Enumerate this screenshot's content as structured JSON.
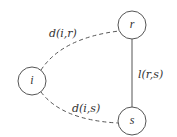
{
  "diagram": {
    "nodes": [
      {
        "id": "r",
        "label": "r",
        "cx": 132,
        "cy": 25,
        "r": 14
      },
      {
        "id": "i",
        "label": "i",
        "cx": 32,
        "cy": 81,
        "r": 14
      },
      {
        "id": "s",
        "label": "s",
        "cx": 132,
        "cy": 121,
        "r": 14
      }
    ],
    "edges": [
      {
        "from": "i",
        "to": "r",
        "label": "d(i,r)",
        "style": "dashed"
      },
      {
        "from": "i",
        "to": "s",
        "label": "d(i,s)",
        "style": "dashed"
      },
      {
        "from": "r",
        "to": "s",
        "label": "l(r,s)",
        "style": "solid"
      }
    ],
    "colors": {
      "stroke": "#555555",
      "text": "#333333",
      "background": "#ffffff"
    }
  }
}
